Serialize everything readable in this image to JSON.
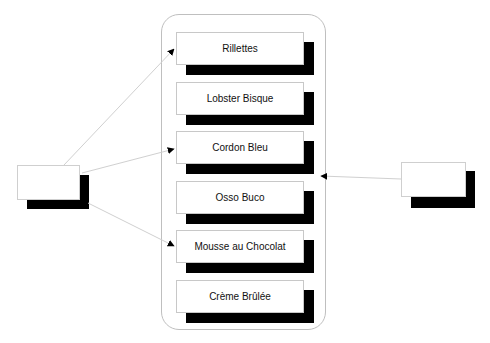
{
  "diagram": {
    "container": {
      "label": ""
    },
    "items": [
      {
        "label": "Rillettes",
        "top": 32
      },
      {
        "label": "Lobster Bisque",
        "top": 82
      },
      {
        "label": "Cordon Bleu",
        "top": 131
      },
      {
        "label": "Osso Buco",
        "top": 181
      },
      {
        "label": "Mousse au Chocolat",
        "top": 230
      },
      {
        "label": "Crème Brûlée",
        "top": 280
      }
    ],
    "left_node": {
      "label": ""
    },
    "right_node": {
      "label": ""
    },
    "connections": [
      {
        "from": "left_node",
        "to": "Rillettes"
      },
      {
        "from": "left_node",
        "to": "Cordon Bleu"
      },
      {
        "from": "left_node",
        "to": "Mousse au Chocolat"
      },
      {
        "from": "right_node",
        "to": "Cordon Bleu"
      }
    ],
    "colors": {
      "shadow": "#000000",
      "border": "#c8c8c8",
      "line": "#d0d0d0",
      "arrow": "#000000"
    }
  }
}
